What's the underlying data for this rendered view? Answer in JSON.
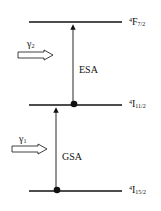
{
  "levels": [
    {
      "sup": "4",
      "base": "F",
      "sub": "7/2"
    },
    {
      "sup": "4",
      "base": "I",
      "sub": "11/2"
    },
    {
      "sup": "4",
      "base": "I",
      "sub": "15/2"
    }
  ],
  "transitions": {
    "esa": "ESA",
    "gsa": "GSA"
  },
  "photons": {
    "gamma2": {
      "symbol": "γ",
      "sub": "2"
    },
    "gamma1": {
      "symbol": "γ",
      "sub": "1"
    }
  }
}
